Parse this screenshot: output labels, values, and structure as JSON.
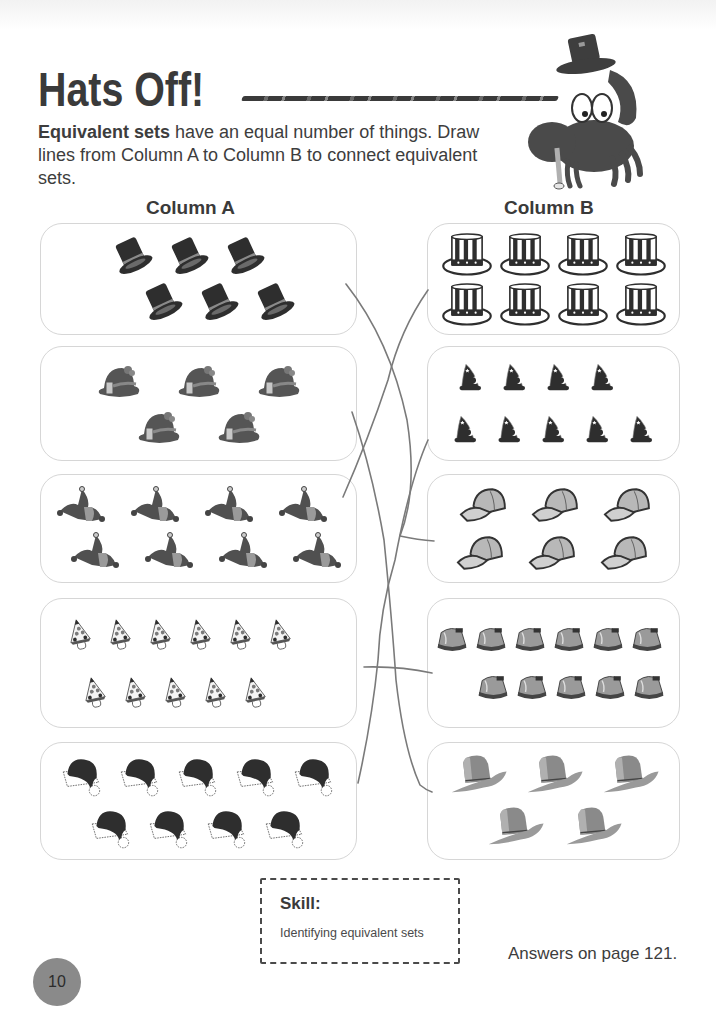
{
  "header": {
    "title": "Hats Off!",
    "intro_bold": "Equivalent sets",
    "intro_rest": " have an equal number of things. Draw lines from Column A to Column B to connect equivalent sets."
  },
  "columns": {
    "a_label": "Column A",
    "b_label": "Column B"
  },
  "column_a": [
    {
      "hat": "top-hat",
      "count": 6,
      "rows": [
        3,
        3
      ]
    },
    {
      "hat": "bonnet-hat",
      "count": 5,
      "rows": [
        3,
        2
      ]
    },
    {
      "hat": "jester-hat",
      "count": 8,
      "rows": [
        4,
        4
      ]
    },
    {
      "hat": "party-hat",
      "count": 11,
      "rows": [
        6,
        5
      ]
    },
    {
      "hat": "santa-hat",
      "count": 9,
      "rows": [
        5,
        4
      ]
    }
  ],
  "column_b": [
    {
      "hat": "uncle-sam-hat",
      "count": 8,
      "rows": [
        4,
        4
      ]
    },
    {
      "hat": "wizard-hat",
      "count": 9,
      "rows": [
        4,
        5
      ]
    },
    {
      "hat": "baseball-cap",
      "count": 6,
      "rows": [
        3,
        3
      ]
    },
    {
      "hat": "bell-hat",
      "count": 11,
      "rows": [
        6,
        5
      ]
    },
    {
      "hat": "cowboy-hat",
      "count": 5,
      "rows": [
        3,
        2
      ]
    }
  ],
  "drawn_connections": [
    {
      "from_a": 1,
      "to_b": 3
    },
    {
      "from_a": 2,
      "to_b": 5
    },
    {
      "from_a": 3,
      "to_b": 1
    },
    {
      "from_a": 4,
      "to_b": 4
    },
    {
      "from_a": 5,
      "to_b": 2
    }
  ],
  "skill": {
    "title": "Skill:",
    "text": "Identifying equivalent sets"
  },
  "footer": {
    "answers": "Answers on page 121.",
    "page_number": "10"
  },
  "colors": {
    "text": "#3d3d3d",
    "box_border": "#d6d6d6",
    "pencil_line": "#7a7a7a",
    "page_badge": "#8a8a8a"
  }
}
